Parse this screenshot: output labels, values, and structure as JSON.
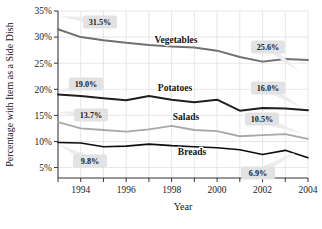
{
  "chart_data": {
    "type": "line",
    "title": "",
    "xlabel": "Year",
    "ylabel": "Percentage with Item as a Side Dish",
    "x": [
      1993,
      1994,
      1995,
      1996,
      1997,
      1998,
      1999,
      2000,
      2001,
      2002,
      2003,
      2004
    ],
    "xlim": [
      1993,
      2004
    ],
    "ylim": [
      3,
      35
    ],
    "grid": true,
    "legend_position": "inline-labels",
    "series": [
      {
        "name": "Vegetables",
        "color": "#707070",
        "values": [
          31.5,
          30.0,
          29.4,
          28.9,
          28.5,
          28.2,
          28.0,
          27.4,
          26.2,
          25.3,
          25.8,
          25.6
        ]
      },
      {
        "name": "Potatoes",
        "color": "#1f1f1f",
        "values": [
          19.0,
          18.7,
          18.3,
          17.9,
          18.7,
          18.0,
          17.5,
          18.0,
          15.9,
          16.4,
          16.3,
          16.0
        ]
      },
      {
        "name": "Salads",
        "color": "#a8a8a8",
        "values": [
          13.7,
          12.5,
          12.2,
          11.9,
          12.3,
          13.0,
          12.2,
          12.0,
          11.0,
          11.2,
          11.4,
          10.5
        ]
      },
      {
        "name": "Breads",
        "color": "#0d0d0d",
        "values": [
          9.8,
          9.7,
          9.0,
          9.1,
          9.5,
          9.2,
          9.0,
          8.8,
          8.4,
          7.5,
          8.3,
          6.9
        ]
      }
    ],
    "ytick_labels": [
      "5%",
      "10%",
      "15%",
      "20%",
      "25%",
      "30%",
      "35%"
    ],
    "ytick_values": [
      5,
      10,
      15,
      20,
      25,
      30,
      35
    ],
    "xtick_labels": [
      "1994",
      "1996",
      "1998",
      "2000",
      "2002",
      "2004"
    ],
    "xtick_values": [
      1994,
      1996,
      1998,
      2000,
      2002,
      2004
    ],
    "annotations": [
      {
        "name": "vegetables-start",
        "text": "31.5%",
        "x_px": 100,
        "y_px": 22,
        "tail_to_x": 60,
        "tail_to_y": 16
      },
      {
        "name": "vegetables-end",
        "text": "25.6%",
        "x_px": 268,
        "y_px": 47,
        "tail_to_x": 300,
        "tail_to_y": 72
      },
      {
        "name": "potatoes-start",
        "text": "19.0%",
        "x_px": 86,
        "y_px": 84,
        "tail_to_x": 58,
        "tail_to_y": 92
      },
      {
        "name": "potatoes-end",
        "text": "16.0%",
        "x_px": 268,
        "y_px": 88,
        "tail_to_x": 302,
        "tail_to_y": 108
      },
      {
        "name": "salads-start",
        "text": "13.7%",
        "x_px": 91,
        "y_px": 115,
        "tail_to_x": 58,
        "tail_to_y": 112
      },
      {
        "name": "salads-end",
        "text": "10.5%",
        "x_px": 262,
        "y_px": 119,
        "tail_to_x": 302,
        "tail_to_y": 134
      },
      {
        "name": "breads-start",
        "text": "9.8%",
        "x_px": 90,
        "y_px": 161,
        "tail_to_x": 58,
        "tail_to_y": 144
      },
      {
        "name": "breads-end",
        "text": "6.9%",
        "x_px": 258,
        "y_px": 173,
        "tail_to_x": 296,
        "tail_to_y": 152
      }
    ],
    "series_label_positions": [
      {
        "name": "Vegetables",
        "x_px": 176,
        "y_px": 43
      },
      {
        "name": "Potatoes",
        "x_px": 175,
        "y_px": 91
      },
      {
        "name": "Salads",
        "x_px": 186,
        "y_px": 120
      },
      {
        "name": "Breads",
        "x_px": 192,
        "y_px": 155
      }
    ]
  }
}
